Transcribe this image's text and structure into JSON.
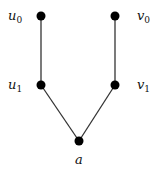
{
  "diagram": {
    "type": "graph",
    "nodes": [
      {
        "id": "u0",
        "label": "u",
        "subscript": "0",
        "x": 41,
        "y": 16,
        "label_x": 8,
        "label_y": 20
      },
      {
        "id": "v0",
        "label": "v",
        "subscript": "0",
        "x": 115,
        "y": 16,
        "label_x": 137,
        "label_y": 20
      },
      {
        "id": "u1",
        "label": "u",
        "subscript": "1",
        "x": 41,
        "y": 85,
        "label_x": 8,
        "label_y": 89
      },
      {
        "id": "v1",
        "label": "v",
        "subscript": "1",
        "x": 115,
        "y": 85,
        "label_x": 137,
        "label_y": 89
      },
      {
        "id": "a",
        "label": "a",
        "subscript": "",
        "x": 79,
        "y": 141,
        "label_x": 75,
        "label_y": 164
      }
    ],
    "edges": [
      {
        "from": "u0",
        "to": "u1"
      },
      {
        "from": "v0",
        "to": "v1"
      },
      {
        "from": "u1",
        "to": "a"
      },
      {
        "from": "v1",
        "to": "a"
      }
    ],
    "node_color": "#000000",
    "edge_color": "#333333"
  }
}
